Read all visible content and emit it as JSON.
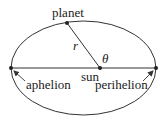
{
  "diagram": {
    "labels": {
      "planet": "planet",
      "sun": "sun",
      "aphelion": "aphelion",
      "perihelion": "perihelion",
      "radius": "r",
      "angle": "θ"
    },
    "colors": {
      "stroke": "#333333",
      "text": "#222222",
      "background": "#ffffff"
    }
  }
}
